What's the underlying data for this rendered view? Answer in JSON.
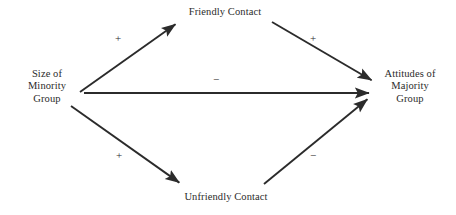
{
  "diagram": {
    "background_color": "#ffffff",
    "line_color": "#2b2b2b",
    "text_color": "#2b2b2b",
    "nodes": [
      {
        "id": "minority",
        "name": "size-of-minority-group",
        "lines": [
          "Size of",
          "Minority",
          "Group"
        ],
        "position": "left"
      },
      {
        "id": "friendly",
        "name": "friendly-contact",
        "lines": [
          "Friendly Contact"
        ],
        "position": "top"
      },
      {
        "id": "unfriendly",
        "name": "unfriendly-contact",
        "lines": [
          "Unfriendly Contact"
        ],
        "position": "bottom"
      },
      {
        "id": "majority",
        "name": "attitudes-of-majority-group",
        "lines": [
          "Attitudes of",
          "Majority",
          "Group"
        ],
        "position": "right"
      }
    ],
    "edges": [
      {
        "id": "minority-to-friendly",
        "from": "minority",
        "to": "friendly",
        "sign": "+",
        "x1": 80,
        "y1": 92,
        "x2": 177,
        "y2": 23
      },
      {
        "id": "friendly-to-majority",
        "from": "friendly",
        "to": "majority",
        "sign": "+",
        "x1": 272,
        "y1": 22,
        "x2": 373,
        "y2": 81
      },
      {
        "id": "minority-to-majority",
        "from": "minority",
        "to": "majority",
        "sign": "−",
        "x1": 84,
        "y1": 93,
        "x2": 371,
        "y2": 93
      },
      {
        "id": "minority-to-unfriendly",
        "from": "minority",
        "to": "unfriendly",
        "sign": "+",
        "x1": 71,
        "y1": 106,
        "x2": 181,
        "y2": 184
      },
      {
        "id": "unfriendly-to-majority",
        "from": "unfriendly",
        "to": "majority",
        "sign": "−",
        "x1": 264,
        "y1": 184,
        "x2": 369,
        "y2": 98
      }
    ],
    "signs": {
      "top_left": "+",
      "top_right": "+",
      "center": "−",
      "bottom_left": "+",
      "bottom_right": "−"
    }
  }
}
